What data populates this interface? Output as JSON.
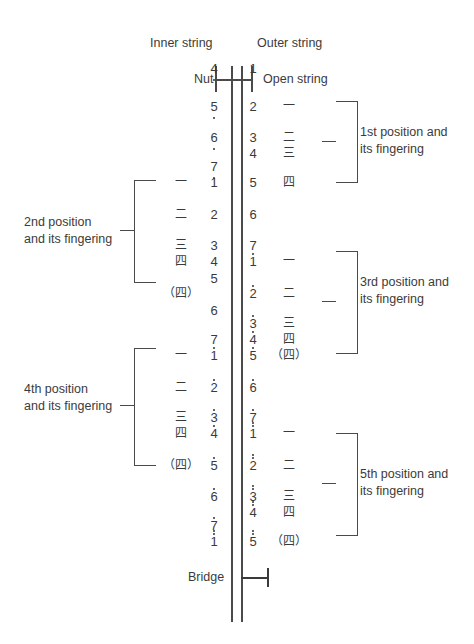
{
  "diagram": {
    "title_labels": {
      "inner_string": "Inner string",
      "outer_string": "Outer string",
      "nut": "Nut",
      "open_string": "Open string",
      "bridge": "Bridge"
    },
    "positions": [
      {
        "id": "pos1",
        "label_line1": "1st position and",
        "label_line2": "its fingering",
        "side": "right"
      },
      {
        "id": "pos2",
        "label_line1": "2nd position",
        "label_line2": "and its fingering",
        "side": "left"
      },
      {
        "id": "pos3",
        "label_line1": "3rd position and",
        "label_line2": "its fingering",
        "side": "right"
      },
      {
        "id": "pos4",
        "label_line1": "4th position",
        "label_line2": "and its fingering",
        "side": "left"
      },
      {
        "id": "pos5",
        "label_line1": "5th position and",
        "label_line2": "its fingering",
        "side": "right"
      }
    ],
    "nut_notes": {
      "inner": "4",
      "inner_dots_below": 1,
      "outer": "1",
      "outer_dots": 0
    },
    "inner_string_notes": [
      {
        "num": "5",
        "dots_below": 1
      },
      {
        "num": "6",
        "dots_below": 1
      },
      {
        "num": "7",
        "dots_below": 1
      },
      {
        "num": "1",
        "dots_below": 0
      },
      {
        "num": "2",
        "dots_below": 0
      },
      {
        "num": "3",
        "dots_below": 0
      },
      {
        "num": "4",
        "dots_below": 0
      },
      {
        "num": "5",
        "dots_below": 0
      },
      {
        "num": "6",
        "dots_below": 0
      },
      {
        "num": "7",
        "dots_below": 0
      },
      {
        "num": "1",
        "dots_above": 1
      },
      {
        "num": "2",
        "dots_above": 1
      },
      {
        "num": "3",
        "dots_above": 1
      },
      {
        "num": "4",
        "dots_above": 1
      },
      {
        "num": "5",
        "dots_above": 1
      },
      {
        "num": "6",
        "dots_above": 1
      },
      {
        "num": "7",
        "dots_above": 1
      },
      {
        "num": "1",
        "dots_above": 2
      }
    ],
    "outer_string_notes": [
      {
        "num": "2",
        "dots": 0
      },
      {
        "num": "3",
        "dots": 0
      },
      {
        "num": "4",
        "dots": 0
      },
      {
        "num": "5",
        "dots": 0
      },
      {
        "num": "6",
        "dots": 0
      },
      {
        "num": "7",
        "dots": 0
      },
      {
        "num": "1",
        "dots_above": 1
      },
      {
        "num": "2",
        "dots_above": 1
      },
      {
        "num": "3",
        "dots_above": 1
      },
      {
        "num": "4",
        "dots_above": 1
      },
      {
        "num": "5",
        "dots_above": 1
      },
      {
        "num": "6",
        "dots_above": 1
      },
      {
        "num": "7",
        "dots_above": 1
      },
      {
        "num": "1",
        "dots_above": 2
      },
      {
        "num": "2",
        "dots_above": 2
      },
      {
        "num": "3",
        "dots_above": 2
      },
      {
        "num": "4",
        "dots_above": 2
      },
      {
        "num": "5",
        "dots_above": 2
      }
    ],
    "inner_fingerings": [
      "一",
      "二",
      "三",
      "四",
      "（四）",
      "一",
      "二",
      "三",
      "四",
      "（四）"
    ],
    "outer_fingerings": [
      "一",
      "二",
      "三",
      "四",
      "一",
      "二",
      "三",
      "四",
      "（四）",
      "一",
      "二",
      "三",
      "四",
      "（四）"
    ],
    "colors": {
      "ink": "#3a3a3a",
      "line": "#4a4a4a",
      "background": "#ffffff"
    }
  }
}
